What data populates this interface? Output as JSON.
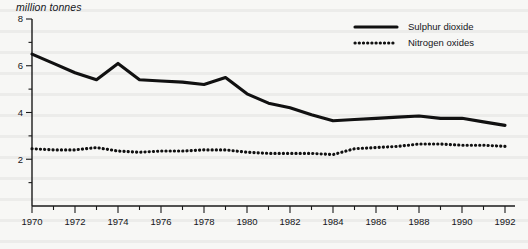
{
  "chart_data": {
    "type": "line",
    "title": "",
    "ylabel": "million tonnes",
    "xlabel": "",
    "ylim": [
      0,
      8
    ],
    "xlim": [
      1970,
      1992
    ],
    "ytick_values": [
      2,
      4,
      6,
      8
    ],
    "ytick_labels": [
      "2",
      "4",
      "6",
      "8"
    ],
    "y_minor_step": 1,
    "xtick_labels": [
      "1970",
      "1972",
      "1974",
      "1976",
      "1978",
      "1980",
      "1982",
      "1984",
      "1986",
      "1988",
      "1990",
      "1992"
    ],
    "xtick_values": [
      1970,
      1972,
      1974,
      1976,
      1978,
      1980,
      1982,
      1984,
      1986,
      1988,
      1990,
      1992
    ],
    "x_minor_step": 1,
    "grid": false,
    "legend_position": "top-right",
    "x": [
      1970,
      1971,
      1972,
      1973,
      1974,
      1975,
      1976,
      1977,
      1978,
      1979,
      1980,
      1981,
      1982,
      1983,
      1984,
      1985,
      1986,
      1987,
      1988,
      1989,
      1990,
      1991,
      1992
    ],
    "series": [
      {
        "name": "Sulphur dioxide",
        "style": "solid",
        "color": "#111111",
        "values": [
          6.5,
          6.1,
          5.7,
          5.4,
          6.1,
          5.4,
          5.35,
          5.3,
          5.2,
          5.5,
          4.8,
          4.4,
          4.2,
          3.9,
          3.65,
          3.7,
          3.75,
          3.8,
          3.85,
          3.75,
          3.75,
          3.6,
          3.45
        ]
      },
      {
        "name": "Nitrogen oxides",
        "style": "dotted",
        "color": "#111111",
        "values": [
          2.45,
          2.4,
          2.4,
          2.5,
          2.35,
          2.3,
          2.35,
          2.35,
          2.4,
          2.4,
          2.3,
          2.25,
          2.25,
          2.25,
          2.2,
          2.45,
          2.5,
          2.55,
          2.65,
          2.65,
          2.6,
          2.6,
          2.55
        ]
      }
    ]
  },
  "legend": {
    "items": [
      {
        "label": "Sulphur dioxide",
        "style": "solid"
      },
      {
        "label": "Nitrogen oxides",
        "style": "dotted"
      }
    ]
  }
}
